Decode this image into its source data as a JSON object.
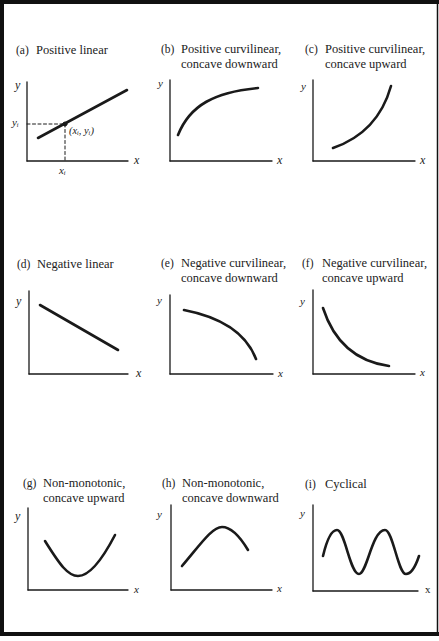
{
  "figure": {
    "panels": [
      {
        "id": "a",
        "tag": "(a)",
        "title_lines": [
          "Positive linear"
        ],
        "x_label": "x",
        "y_label": "y",
        "annotations": {
          "point_label": "(xᵢ, yᵢ)",
          "x_tick_label": "xᵢ",
          "y_tick_label": "yᵢ"
        }
      },
      {
        "id": "b",
        "tag": "(b)",
        "title_lines": [
          "Positive curvilinear,",
          "concave downward"
        ],
        "x_label": "x",
        "y_label": "y"
      },
      {
        "id": "c",
        "tag": "(c)",
        "title_lines": [
          "Positive curvilinear,",
          "concave upward"
        ],
        "x_label": "x",
        "y_label": "y"
      },
      {
        "id": "d",
        "tag": "(d)",
        "title_lines": [
          "Negative linear"
        ],
        "x_label": "x",
        "y_label": "y"
      },
      {
        "id": "e",
        "tag": "(e)",
        "title_lines": [
          "Negative curvilinear,",
          "concave downward"
        ],
        "x_label": "x",
        "y_label": "y"
      },
      {
        "id": "f",
        "tag": "(f)",
        "title_lines": [
          "Negative curvilinear,",
          "concave upward"
        ],
        "x_label": "x",
        "y_label": "y"
      },
      {
        "id": "g",
        "tag": "(g)",
        "title_lines": [
          "Non-monotonic,",
          "concave upward"
        ],
        "x_label": "x",
        "y_label": "y"
      },
      {
        "id": "h",
        "tag": "(h)",
        "title_lines": [
          "Non-monotonic,",
          "concave downward"
        ],
        "x_label": "x",
        "y_label": "y"
      },
      {
        "id": "i",
        "tag": "(i)",
        "title_lines": [
          "Cyclical"
        ],
        "x_label": "x",
        "y_label": "y"
      }
    ],
    "colors": {
      "ink": "#1a1a1a",
      "frame": "#111111",
      "background": "#ffffff"
    }
  }
}
